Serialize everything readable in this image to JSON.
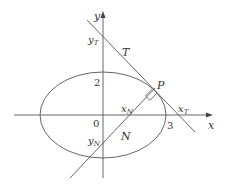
{
  "diagram": {
    "colors": {
      "stroke": "#555555",
      "text": "#333333",
      "background": "#ffffff"
    },
    "axes": {
      "x_label": "x",
      "y_label": "y",
      "origin_label": "0"
    },
    "ellipse": {
      "semi_major_label": "3",
      "semi_minor_label": "2"
    },
    "point": {
      "label": "P"
    },
    "tangent": {
      "label": "T",
      "x_intercept_label": {
        "base": "x",
        "sub": "T"
      },
      "y_intercept_label": {
        "base": "y",
        "sub": "T"
      }
    },
    "normal": {
      "label": "N",
      "x_intercept_label": {
        "base": "x",
        "sub": "N"
      },
      "y_intercept_label": {
        "base": "y",
        "sub": "N"
      }
    }
  }
}
